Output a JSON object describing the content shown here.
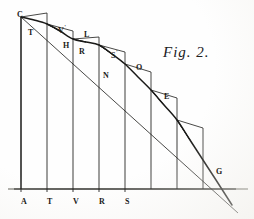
{
  "figure": {
    "caption": "Fig. 2.",
    "background_color": "#fefefe",
    "ink_color": "#1a1a18"
  },
  "axis_labels": [
    {
      "text": "A",
      "x": 21,
      "y": 198
    },
    {
      "text": "T",
      "x": 47,
      "y": 198
    },
    {
      "text": "V",
      "x": 73,
      "y": 198
    },
    {
      "text": "R",
      "x": 99,
      "y": 198
    },
    {
      "text": "S",
      "x": 125,
      "y": 198
    }
  ],
  "curve_labels": [
    {
      "text": "C",
      "prime": false,
      "x": 17,
      "y": 11
    },
    {
      "text": "T",
      "prime": false,
      "x": 28,
      "y": 29
    },
    {
      "text": "V",
      "prime": true,
      "x": 58,
      "y": 24
    },
    {
      "text": "H",
      "prime": false,
      "x": 63,
      "y": 42
    },
    {
      "text": "L",
      "prime": false,
      "x": 84,
      "y": 31
    },
    {
      "text": "R",
      "prime": false,
      "x": 79,
      "y": 48
    },
    {
      "text": "S",
      "prime": true,
      "x": 111,
      "y": 49
    },
    {
      "text": "N",
      "prime": false,
      "x": 103,
      "y": 72
    },
    {
      "text": "O",
      "prime": false,
      "x": 136,
      "y": 64
    },
    {
      "text": "E",
      "prime": false,
      "x": 164,
      "y": 93
    },
    {
      "text": "G",
      "prime": false,
      "x": 216,
      "y": 168
    }
  ],
  "chart_data": {
    "type": "line",
    "title": "Fig. 2.",
    "xlabel": "",
    "ylabel": "",
    "grid": false,
    "legend": "none",
    "xlim": [
      21,
      203
    ],
    "ylim": [
      189,
      17
    ],
    "baseline_y": 189,
    "ordinate_xs": [
      21,
      47,
      73,
      99,
      125,
      151,
      177,
      203
    ],
    "ordinate_tops": [
      17,
      24,
      39,
      45,
      64,
      90,
      120,
      160
    ],
    "curve_points": [
      {
        "x": 21,
        "y": 17
      },
      {
        "x": 34,
        "y": 20
      },
      {
        "x": 47,
        "y": 24
      },
      {
        "x": 60,
        "y": 31
      },
      {
        "x": 73,
        "y": 39
      },
      {
        "x": 86,
        "y": 42
      },
      {
        "x": 99,
        "y": 45
      },
      {
        "x": 112,
        "y": 54
      },
      {
        "x": 125,
        "y": 64
      },
      {
        "x": 138,
        "y": 77
      },
      {
        "x": 151,
        "y": 90
      },
      {
        "x": 164,
        "y": 105
      },
      {
        "x": 177,
        "y": 120
      },
      {
        "x": 190,
        "y": 140
      },
      {
        "x": 203,
        "y": 160
      },
      {
        "x": 216,
        "y": 180
      },
      {
        "x": 232,
        "y": 205
      }
    ],
    "step_polygon": [
      {
        "x": 21,
        "y": 17
      },
      {
        "x": 47,
        "y": 13
      },
      {
        "x": 47,
        "y": 24
      },
      {
        "x": 60,
        "y": 31
      },
      {
        "x": 47,
        "y": 24
      },
      {
        "x": 73,
        "y": 31
      },
      {
        "x": 73,
        "y": 39
      },
      {
        "x": 86,
        "y": 42
      },
      {
        "x": 73,
        "y": 39
      },
      {
        "x": 99,
        "y": 37
      },
      {
        "x": 99,
        "y": 45
      },
      {
        "x": 112,
        "y": 54
      },
      {
        "x": 99,
        "y": 45
      },
      {
        "x": 125,
        "y": 52
      },
      {
        "x": 125,
        "y": 64
      },
      {
        "x": 138,
        "y": 77
      },
      {
        "x": 125,
        "y": 64
      },
      {
        "x": 151,
        "y": 72
      },
      {
        "x": 151,
        "y": 90
      },
      {
        "x": 164,
        "y": 105
      },
      {
        "x": 151,
        "y": 90
      },
      {
        "x": 177,
        "y": 98
      },
      {
        "x": 177,
        "y": 120
      },
      {
        "x": 190,
        "y": 140
      },
      {
        "x": 177,
        "y": 120
      },
      {
        "x": 203,
        "y": 128
      },
      {
        "x": 203,
        "y": 160
      }
    ],
    "secant_line": {
      "x1": 21,
      "y1": 17,
      "x2": 238,
      "y2": 213
    }
  }
}
